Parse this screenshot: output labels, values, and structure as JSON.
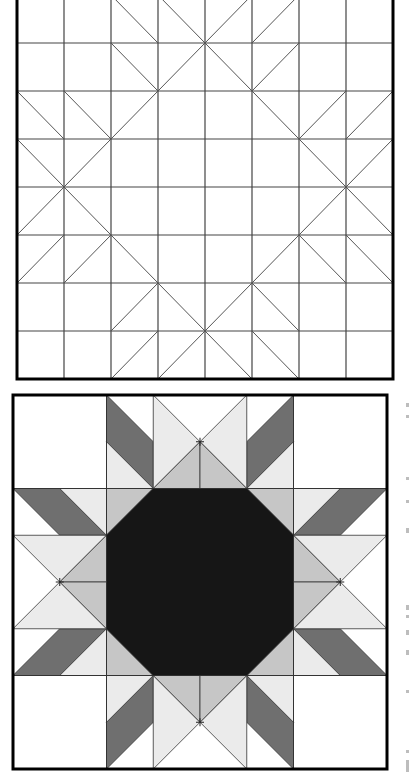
{
  "figure": {
    "grid_units": 8,
    "top_diagram": {
      "name": "line-drawing",
      "origin": [
        17,
        -5
      ],
      "unit": [
        47,
        48
      ],
      "grid_lines": true,
      "diagonals": [
        [
          [
            3,
            0
          ],
          [
            8,
            5
          ]
        ],
        [
          [
            5,
            0
          ],
          [
            0,
            5
          ]
        ],
        [
          [
            0,
            3
          ],
          [
            5,
            8
          ]
        ],
        [
          [
            8,
            3
          ],
          [
            3,
            8
          ]
        ],
        [
          [
            2,
            0
          ],
          [
            3,
            1
          ]
        ],
        [
          [
            2,
            1
          ],
          [
            3,
            2
          ]
        ],
        [
          [
            6,
            0
          ],
          [
            5,
            1
          ]
        ],
        [
          [
            6,
            1
          ],
          [
            5,
            2
          ]
        ],
        [
          [
            0,
            2
          ],
          [
            1,
            3
          ]
        ],
        [
          [
            1,
            2
          ],
          [
            2,
            3
          ]
        ],
        [
          [
            8,
            2
          ],
          [
            7,
            3
          ]
        ],
        [
          [
            7,
            2
          ],
          [
            6,
            3
          ]
        ],
        [
          [
            0,
            6
          ],
          [
            1,
            5
          ]
        ],
        [
          [
            1,
            6
          ],
          [
            2,
            5
          ]
        ],
        [
          [
            8,
            6
          ],
          [
            7,
            5
          ]
        ],
        [
          [
            7,
            6
          ],
          [
            6,
            5
          ]
        ],
        [
          [
            2,
            8
          ],
          [
            3,
            7
          ]
        ],
        [
          [
            2,
            7
          ],
          [
            3,
            6
          ]
        ],
        [
          [
            6,
            8
          ],
          [
            5,
            7
          ]
        ],
        [
          [
            6,
            7
          ],
          [
            5,
            6
          ]
        ]
      ]
    },
    "bottom_diagram": {
      "name": "shaded-block",
      "origin": [
        13,
        395
      ],
      "unit": 46.75,
      "colors": {
        "white": "#ffffff",
        "light": "#ebebeb",
        "medium": "#c6c6c6",
        "dark": "#6f6f6f",
        "black": "#161616",
        "line": "#333333"
      }
    },
    "side_text": "cropped rotated caption (illegible)"
  }
}
